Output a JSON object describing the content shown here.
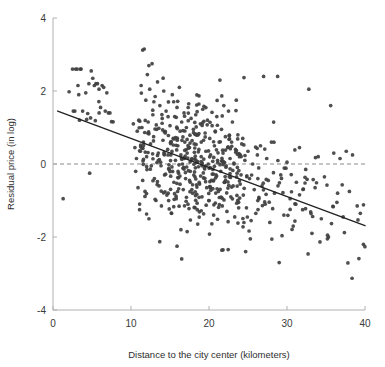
{
  "chart_data": {
    "type": "scatter",
    "title": "",
    "xlabel": "Distance to the city center (kilometers)",
    "ylabel": "Residual price (in log)",
    "xlim": [
      0,
      40
    ],
    "ylim": [
      -4,
      4
    ],
    "xticks": [
      0,
      10,
      20,
      30,
      40
    ],
    "yticks": [
      -4,
      -2,
      0,
      2,
      4
    ],
    "xtick_labels": [
      "0",
      "10",
      "20",
      "30",
      "40"
    ],
    "ytick_labels": [
      "-4",
      "-2",
      "0",
      "2",
      "4"
    ],
    "grid": false,
    "legend": "none",
    "reference_line": {
      "name": "zero-residual-line",
      "y": 0,
      "style": "dashed",
      "color": "#8a8a8a"
    },
    "fit_line": {
      "name": "regression-line",
      "style": "solid",
      "color": "#222222",
      "x0": 0.6,
      "y0": 1.45,
      "x1": 40.5,
      "y1": -1.73,
      "slope": -0.0797,
      "intercept": 1.498
    },
    "marker": {
      "shape": "circle",
      "color": "#404040",
      "radius_px": 1.85,
      "opacity": 0.92
    },
    "n_points": 620,
    "points": [
      [
        1.3,
        -0.95
      ],
      [
        2.5,
        2.6
      ],
      [
        2.6,
        1.45
      ],
      [
        2.8,
        1.45
      ],
      [
        2.9,
        2.6
      ],
      [
        3.1,
        2.6
      ],
      [
        3.2,
        2.15
      ],
      [
        3.3,
        1.9
      ],
      [
        3.4,
        1.2
      ],
      [
        3.5,
        2.6
      ],
      [
        3.6,
        2.6
      ],
      [
        3.8,
        1.45
      ],
      [
        4.2,
        1.95
      ],
      [
        4.6,
        2.2
      ],
      [
        4.7,
        -0.25
      ],
      [
        4.9,
        2.55
      ],
      [
        5.1,
        2.35
      ],
      [
        5.3,
        2.15
      ],
      [
        5.5,
        2.2
      ],
      [
        5.7,
        2.2
      ],
      [
        5.9,
        2.05
      ],
      [
        6.1,
        1.55
      ],
      [
        6.3,
        2.15
      ],
      [
        6.5,
        2.1
      ],
      [
        6.7,
        1.45
      ],
      [
        6.9,
        1.95
      ],
      [
        7.1,
        1.4
      ],
      [
        7.3,
        1.4
      ],
      [
        10.3,
        1.1
      ],
      [
        10.5,
        0.45
      ],
      [
        10.6,
        -0.2
      ],
      [
        10.7,
        0.15
      ],
      [
        10.8,
        0.9
      ],
      [
        10.9,
        -0.65
      ],
      [
        11.0,
        1.2
      ],
      [
        11.1,
        -1.25
      ],
      [
        11.2,
        0.35
      ],
      [
        11.3,
        2.15
      ],
      [
        11.4,
        1.0
      ],
      [
        11.5,
        -0.45
      ],
      [
        11.6,
        0.6
      ],
      [
        11.7,
        3.15
      ],
      [
        11.8,
        -0.75
      ],
      [
        11.9,
        1.75
      ],
      [
        12.0,
        0.2
      ],
      [
        12.1,
        2.45
      ],
      [
        12.2,
        1.15
      ],
      [
        12.3,
        -1.5
      ],
      [
        12.4,
        2.05
      ],
      [
        12.5,
        0.55
      ],
      [
        12.6,
        -0.05
      ],
      [
        12.7,
        2.75
      ],
      [
        12.8,
        1.35
      ],
      [
        12.9,
        0.75
      ],
      [
        13.0,
        -0.4
      ],
      [
        13.1,
        1.85
      ],
      [
        13.2,
        -1.0
      ],
      [
        13.3,
        0.95
      ],
      [
        13.4,
        2.25
      ],
      [
        13.5,
        0.3
      ],
      [
        13.6,
        -0.6
      ],
      [
        13.7,
        1.6
      ],
      [
        13.8,
        0.05
      ],
      [
        13.9,
        -1.15
      ],
      [
        14.0,
        1.25
      ],
      [
        14.1,
        0.65
      ],
      [
        14.2,
        2.0
      ],
      [
        14.3,
        -0.3
      ],
      [
        14.4,
        0.85
      ],
      [
        14.5,
        1.45
      ],
      [
        14.6,
        -0.85
      ],
      [
        14.7,
        0.4
      ],
      [
        14.8,
        1.7
      ],
      [
        14.9,
        -0.15
      ],
      [
        15.0,
        1.05
      ],
      [
        15.1,
        0.25
      ],
      [
        15.2,
        -1.35
      ],
      [
        15.3,
        1.9
      ],
      [
        15.4,
        0.7
      ],
      [
        15.5,
        -0.5
      ],
      [
        15.6,
        1.3
      ],
      [
        15.7,
        0.1
      ],
      [
        15.8,
        -0.95
      ],
      [
        15.9,
        1.55
      ],
      [
        16.0,
        0.5
      ],
      [
        16.1,
        -0.25
      ],
      [
        16.2,
        2.1
      ],
      [
        16.3,
        0.9
      ],
      [
        16.4,
        -1.8
      ],
      [
        16.5,
        1.15
      ],
      [
        16.6,
        0.0
      ],
      [
        16.7,
        -0.7
      ],
      [
        16.8,
        1.4
      ],
      [
        16.9,
        0.6
      ],
      [
        17.0,
        -0.4
      ],
      [
        17.1,
        1.0
      ],
      [
        17.2,
        0.3
      ],
      [
        17.3,
        -1.1
      ],
      [
        17.4,
        1.65
      ],
      [
        17.5,
        0.45
      ],
      [
        17.6,
        -0.2
      ],
      [
        17.7,
        1.25
      ],
      [
        17.8,
        0.15
      ],
      [
        17.9,
        -0.8
      ],
      [
        18.0,
        0.95
      ],
      [
        18.1,
        0.55
      ],
      [
        18.2,
        -0.35
      ],
      [
        18.3,
        1.35
      ],
      [
        18.4,
        0.05
      ],
      [
        18.5,
        -1.25
      ],
      [
        18.6,
        0.8
      ],
      [
        18.7,
        0.4
      ],
      [
        18.8,
        -0.55
      ],
      [
        18.9,
        1.1
      ],
      [
        19.0,
        0.2
      ],
      [
        19.1,
        -0.9
      ],
      [
        19.2,
        1.5
      ],
      [
        19.3,
        0.65
      ],
      [
        19.4,
        -0.1
      ],
      [
        19.5,
        0.85
      ],
      [
        19.6,
        0.35
      ],
      [
        19.7,
        -0.65
      ],
      [
        19.8,
        1.2
      ],
      [
        19.9,
        0.0
      ],
      [
        20.0,
        -1.0
      ],
      [
        20.1,
        0.7
      ],
      [
        20.2,
        0.25
      ],
      [
        20.3,
        -0.45
      ],
      [
        20.4,
        1.05
      ],
      [
        20.5,
        -0.15
      ],
      [
        20.6,
        -1.4
      ],
      [
        20.7,
        0.5
      ],
      [
        20.8,
        0.9
      ],
      [
        20.9,
        -0.3
      ],
      [
        21.0,
        1.3
      ],
      [
        21.1,
        0.1
      ],
      [
        21.2,
        -0.75
      ],
      [
        21.3,
        0.6
      ],
      [
        21.4,
        2.3
      ],
      [
        21.5,
        -0.2
      ],
      [
        21.6,
        0.95
      ],
      [
        21.7,
        -1.15
      ],
      [
        21.8,
        0.3
      ],
      [
        21.9,
        1.6
      ],
      [
        22.0,
        -0.5
      ],
      [
        22.1,
        0.75
      ],
      [
        22.2,
        -0.05
      ],
      [
        22.3,
        -1.3
      ],
      [
        22.4,
        0.45
      ],
      [
        22.5,
        1.45
      ],
      [
        22.6,
        -0.35
      ],
      [
        22.7,
        0.15
      ],
      [
        22.8,
        -0.9
      ],
      [
        22.9,
        0.6
      ],
      [
        23.0,
        1.15
      ],
      [
        23.1,
        -0.6
      ],
      [
        23.2,
        0.0
      ],
      [
        23.3,
        -1.45
      ],
      [
        23.4,
        0.4
      ],
      [
        23.5,
        1.75
      ],
      [
        23.6,
        -0.25
      ],
      [
        23.7,
        0.8
      ],
      [
        23.8,
        -1.05
      ],
      [
        23.9,
        0.2
      ],
      [
        24.0,
        -0.55
      ],
      [
        24.2,
        0.55
      ],
      [
        24.4,
        -0.85
      ],
      [
        24.6,
        0.1
      ],
      [
        24.8,
        -1.2
      ],
      [
        25.0,
        0.35
      ],
      [
        25.2,
        -0.4
      ],
      [
        25.4,
        -1.55
      ],
      [
        25.6,
        0.0
      ],
      [
        25.8,
        -0.7
      ],
      [
        26.0,
        -1.35
      ],
      [
        26.2,
        0.25
      ],
      [
        26.4,
        -0.95
      ],
      [
        26.6,
        0.5
      ],
      [
        26.8,
        -0.6
      ],
      [
        27.0,
        2.4
      ],
      [
        27.2,
        -1.1
      ],
      [
        27.4,
        0.15
      ],
      [
        27.6,
        -0.45
      ],
      [
        27.8,
        -1.6
      ],
      [
        28.0,
        0.6
      ],
      [
        28.4,
        -0.8
      ],
      [
        28.8,
        2.4
      ],
      [
        29.0,
        -2.7
      ],
      [
        29.2,
        -0.3
      ],
      [
        29.6,
        -1.4
      ],
      [
        30.0,
        0.05
      ],
      [
        30.4,
        -0.95
      ],
      [
        30.8,
        -1.7
      ],
      [
        31.2,
        -0.5
      ],
      [
        31.6,
        0.45
      ],
      [
        32.0,
        -1.25
      ],
      [
        32.4,
        -0.15
      ],
      [
        32.8,
        2.05
      ],
      [
        33.2,
        -1.9
      ],
      [
        33.6,
        -0.65
      ],
      [
        34.0,
        0.2
      ],
      [
        34.4,
        -1.5
      ],
      [
        34.8,
        -0.35
      ],
      [
        35.2,
        -1.95
      ],
      [
        35.6,
        1.6
      ],
      [
        36.0,
        0.3
      ],
      [
        36.4,
        -1.05
      ],
      [
        36.8,
        0.15
      ],
      [
        37.2,
        -1.45
      ],
      [
        37.6,
        0.35
      ],
      [
        38.0,
        -0.75
      ],
      [
        38.4,
        0.25
      ],
      [
        39.0,
        -1.15
      ],
      [
        39.4,
        -1.35
      ],
      [
        39.8,
        -2.2
      ],
      [
        16.5,
        -2.6
      ],
      [
        15.9,
        -2.25
      ],
      [
        21.8,
        -2.35
      ],
      [
        24.7,
        -2.4
      ],
      [
        17.2,
        -1.85
      ],
      [
        25.3,
        -2.05
      ]
    ]
  }
}
